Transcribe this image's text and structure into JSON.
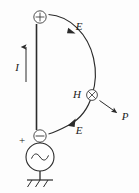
{
  "figure": {
    "background_color": "#fdfdfd",
    "ink_color": "#2b2b2b"
  },
  "labels": {
    "current": "I",
    "efield_upper": "E",
    "efield_lower": "E",
    "hfield": "H",
    "poynting": "P",
    "terminal_plus": "+"
  },
  "symbols": {
    "top_terminal": "⊕",
    "bottom_terminal": "⊖",
    "hfield_into_page": "⊗",
    "ac_source": "∿"
  },
  "elements": {
    "antenna_label": "antenna wire",
    "current_arrow_label": "current direction arrow",
    "ground_label": "ground symbol",
    "source_label": "AC voltage source",
    "efield_arc_label": "electric field line",
    "poynting_arrow_label": "Poynting vector arrow"
  },
  "geometry": {
    "antenna_x": 36.5,
    "antenna_top_y": 24,
    "antenna_bottom_y": 130,
    "top_node": [
      40,
      17
    ],
    "bottom_node": [
      40,
      136
    ],
    "h_node": [
      92,
      95
    ],
    "source_center": [
      40,
      157
    ],
    "source_radius": 14,
    "ground_y": 180,
    "poynting_tip": [
      118,
      114
    ]
  }
}
